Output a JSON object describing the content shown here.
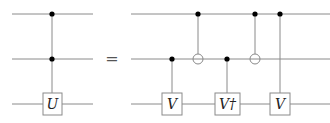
{
  "diagram": {
    "type": "quantum-circuit-identity",
    "wires_y": [
      14,
      59,
      104
    ],
    "equals_sign": "=",
    "left_circuit": {
      "x_start": 12,
      "x_end": 93,
      "gates": [
        {
          "kind": "controlled",
          "x": 52,
          "controls": [
            0,
            1
          ],
          "target": 2,
          "label": "U"
        }
      ]
    },
    "right_circuit": {
      "x_start": 131,
      "x_end": 330,
      "gates": [
        {
          "kind": "controlled",
          "x": 172,
          "controls": [
            1
          ],
          "target": 2,
          "label": "V"
        },
        {
          "kind": "cnot",
          "x": 198,
          "controls": [
            0
          ],
          "target": 1
        },
        {
          "kind": "controlled",
          "x": 227,
          "controls": [
            1
          ],
          "target": 2,
          "label": "V†"
        },
        {
          "kind": "cnot",
          "x": 255,
          "controls": [
            0
          ],
          "target": 1
        },
        {
          "kind": "controlled",
          "x": 280,
          "controls": [
            0
          ],
          "target": 2,
          "label": "V"
        }
      ]
    },
    "labels": {
      "U": "U",
      "V1": "V",
      "Vdag": "V†",
      "V2": "V",
      "equals": "="
    }
  }
}
